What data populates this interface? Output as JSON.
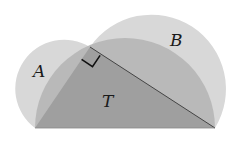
{
  "diagram": {
    "labels": {
      "lune_a": "A",
      "lune_b": "B",
      "triangle": "T"
    },
    "colors": {
      "light": "#d8d8d8",
      "mid": "#b8b8b8",
      "dark": "#9e9e9e",
      "stroke": "#333333"
    }
  }
}
